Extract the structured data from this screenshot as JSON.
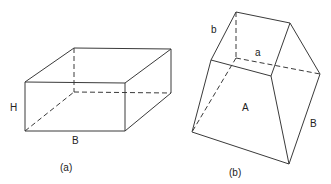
{
  "figure_a": {
    "caption": "(a)",
    "labels": {
      "height": "H",
      "base": "B"
    },
    "vertices": {
      "front_top_left": [
        25,
        82
      ],
      "front_top_right": [
        125,
        83
      ],
      "front_bottom_left": [
        25,
        131
      ],
      "front_bottom_right": [
        125,
        131
      ],
      "back_top_left": [
        74,
        48
      ],
      "back_top_right": [
        171,
        49
      ],
      "back_bottom_left": [
        74,
        92
      ],
      "back_bottom_right": [
        171,
        93
      ]
    }
  },
  "figure_b": {
    "caption": "(b)",
    "labels": {
      "top_side_b": "b",
      "top_side_a": "a",
      "face_area": "A",
      "side_B": "B"
    },
    "vertices": {
      "top_back_left": [
        236,
        12
      ],
      "top_back_right": [
        290,
        23
      ],
      "top_front_left": [
        211,
        60
      ],
      "top_front_right": [
        271,
        76
      ],
      "hidden_inner": [
        236,
        58
      ],
      "right_vertex": [
        320,
        74
      ],
      "bottom_left": [
        192,
        132
      ],
      "bottom_right": [
        289,
        164
      ]
    }
  },
  "colors": {
    "line": "#3a3a3a",
    "text": "#222222",
    "background": "#ffffff"
  }
}
